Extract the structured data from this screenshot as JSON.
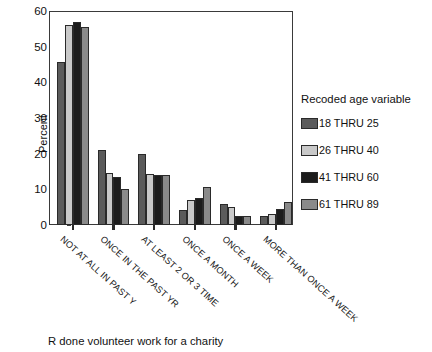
{
  "chart_data": {
    "type": "bar",
    "title": "",
    "xlabel": "R done volunteer work for a charity",
    "ylabel": "Percent",
    "ylim": [
      0,
      60
    ],
    "yticks": [
      0,
      10,
      20,
      30,
      40,
      50,
      60
    ],
    "grid": false,
    "legend_position": "right",
    "legend_title": "Recoded age variable",
    "categories": [
      "NOT AT ALL IN PAST Y",
      "ONCE IN THE PAST YR",
      "AT LEAST 2 OR 3 TIME",
      "ONCE A MONTH",
      "ONCE A WEEK",
      "MORE THAN ONCE A WEEK"
    ],
    "series": [
      {
        "name": "18 THRU 25",
        "color": "#5b5b5b",
        "values": [
          45.6,
          21.0,
          20.0,
          4.2,
          6.0,
          2.4
        ]
      },
      {
        "name": "26 THRU 40",
        "color": "#c9c9c9",
        "values": [
          56.0,
          14.6,
          14.2,
          7.0,
          5.0,
          3.0
        ]
      },
      {
        "name": "41 THRU 60",
        "color": "#1c1c1c",
        "values": [
          57.0,
          13.5,
          14.0,
          7.6,
          2.6,
          4.6
        ]
      },
      {
        "name": "61 THRU 89",
        "color": "#8a8a8a",
        "values": [
          55.5,
          10.2,
          14.0,
          10.6,
          2.6,
          6.4
        ]
      }
    ]
  },
  "caption": "R done volunteer work for a charity"
}
